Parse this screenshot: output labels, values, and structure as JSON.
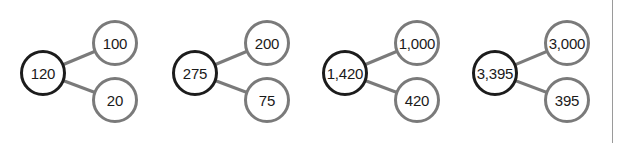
{
  "diagram": {
    "type": "number-bonds",
    "colors": {
      "whole_border": "#1c1c1c",
      "part_border": "#7a7a7a",
      "connector": "#7a7a7a"
    },
    "bonds": [
      {
        "whole": "120",
        "parts": [
          "100",
          "20"
        ]
      },
      {
        "whole": "275",
        "parts": [
          "200",
          "75"
        ]
      },
      {
        "whole": "1,420",
        "parts": [
          "1,000",
          "420"
        ]
      },
      {
        "whole": "3,395",
        "parts": [
          "3,000",
          "395"
        ]
      }
    ]
  }
}
